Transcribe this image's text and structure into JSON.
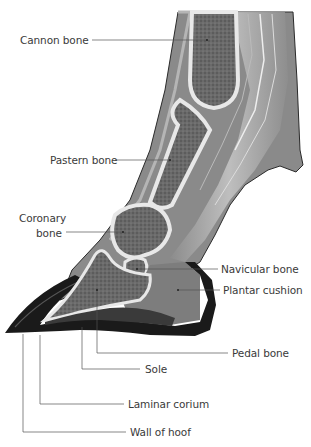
{
  "diagram": {
    "colors": {
      "background": "#ffffff",
      "label_text": "#3a3a3a",
      "leader_line": "#555555",
      "hoof_wall": "#1a1a1a",
      "bone_cortex": "#e8e8e8",
      "bone_marrow": "#6e6e6e",
      "tendon": "#9a9a9a",
      "soft_tissue": "#8a8a8a",
      "plantar_cushion": "#7d7d7d"
    },
    "labels": [
      {
        "id": "cannon-bone",
        "text": "Cannon bone",
        "x": 20,
        "y": 34,
        "anchor": [
          207,
          40
        ]
      },
      {
        "id": "pastern-bone",
        "text": "Pastern bone",
        "x": 50,
        "y": 154,
        "anchor": [
          170,
          160
        ]
      },
      {
        "id": "coronary-bone-1",
        "text": "Coronary",
        "x": 19,
        "y": 212
      },
      {
        "id": "coronary-bone-2",
        "text": "bone",
        "x": 36,
        "y": 227,
        "anchor": [
          123,
          232
        ]
      },
      {
        "id": "navicular-bone",
        "text": "Navicular bone",
        "x": 221,
        "y": 263,
        "anchor": [
          137,
          269
        ]
      },
      {
        "id": "plantar-cushion",
        "text": "Plantar cushion",
        "x": 223,
        "y": 284,
        "anchor": [
          178,
          290
        ]
      },
      {
        "id": "pedal-bone",
        "text": "Pedal bone",
        "x": 232,
        "y": 347,
        "anchor": [
          97,
          290
        ]
      },
      {
        "id": "sole",
        "text": "Sole",
        "x": 145,
        "y": 363,
        "anchor": [
          82,
          327
        ]
      },
      {
        "id": "laminar-corium",
        "text": "Laminar corium",
        "x": 128,
        "y": 398,
        "anchor": [
          40,
          335
        ]
      },
      {
        "id": "wall-of-hoof",
        "text": "Wall of hoof",
        "x": 130,
        "y": 426,
        "anchor": [
          23,
          334
        ]
      }
    ]
  }
}
